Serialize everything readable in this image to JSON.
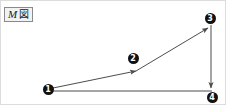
{
  "figure": {
    "caption": {
      "letter": "M",
      "cjk": "図",
      "full_text": "M図"
    },
    "canvas": {
      "width": 226,
      "height": 105,
      "background_color": "#ffffff",
      "frame_color": "#dcdcdc"
    },
    "style": {
      "line_color": "#4d4d4d",
      "node_fill_color": "#111111",
      "node_text_color": "#ffffff",
      "caption_border_color": "#8a8a8a",
      "caption_background_color": "#f2f2f2"
    }
  },
  "chart_data": {
    "type": "diagram",
    "nodes": [
      {
        "id": "1",
        "label": "❶",
        "number": "1",
        "x": 48,
        "y": 89
      },
      {
        "id": "2",
        "label": "❷",
        "number": "2",
        "x": 133,
        "y": 58
      },
      {
        "id": "3",
        "label": "❸",
        "number": "3",
        "x": 210,
        "y": 18
      },
      {
        "id": "4",
        "label": "❹",
        "number": "4",
        "x": 212,
        "y": 97
      }
    ],
    "edges": [
      {
        "id": "edge-1-2",
        "from": "1",
        "to": "2",
        "arrow": true,
        "x1": 53,
        "y1": 88,
        "x2": 136,
        "y2": 71
      },
      {
        "id": "edge-2-3",
        "from": "2",
        "to": "3",
        "arrow": true,
        "x1": 136,
        "y1": 71,
        "x2": 208,
        "y2": 28
      },
      {
        "id": "edge-3-4",
        "from": "3",
        "to": "4",
        "arrow": true,
        "x1": 211,
        "y1": 25,
        "x2": 211,
        "y2": 88
      },
      {
        "id": "edge-1-4",
        "from": "1",
        "to": "4",
        "arrow": false,
        "x1": 53,
        "y1": 91,
        "x2": 212,
        "y2": 91
      }
    ]
  }
}
